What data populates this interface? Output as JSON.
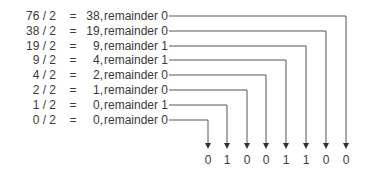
{
  "rows": [
    {
      "dividend": "76 / 2",
      "eq": "=",
      "quotient": "38,",
      "remainder": "remainder 0"
    },
    {
      "dividend": "38 / 2",
      "eq": "=",
      "quotient": "19,",
      "remainder": "remainder 0"
    },
    {
      "dividend": "19 / 2",
      "eq": "=",
      "quotient": "9,",
      "remainder": "remainder 1"
    },
    {
      "dividend": "9 / 2",
      "eq": "=",
      "quotient": "4,",
      "remainder": "remainder 1"
    },
    {
      "dividend": "4 / 2",
      "eq": "=",
      "quotient": "2,",
      "remainder": "remainder 0"
    },
    {
      "dividend": "2 / 2",
      "eq": "=",
      "quotient": "1,",
      "remainder": "remainder 0"
    },
    {
      "dividend": "1 / 2",
      "eq": "=",
      "quotient": "0,",
      "remainder": "remainder 1"
    },
    {
      "dividend": "0 / 2",
      "eq": "=",
      "quotient": "0,",
      "remainder": "remainder 0"
    }
  ],
  "result_bits": [
    "0",
    "1",
    "0",
    "0",
    "1",
    "1",
    "0",
    "0"
  ],
  "colors": {
    "text": "#3a3a3a",
    "line": "#555555"
  }
}
